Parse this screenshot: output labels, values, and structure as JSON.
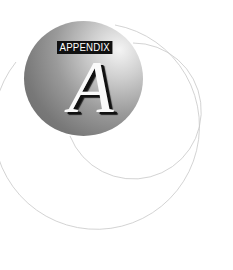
{
  "emblem": {
    "label": "APPENDIX",
    "letter": "A"
  },
  "colors": {
    "label_bg": "#111111",
    "label_text": "#ffffff",
    "arc_stroke": "#c8c8c8"
  }
}
